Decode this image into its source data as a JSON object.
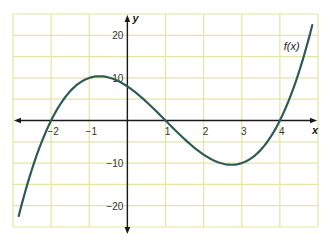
{
  "chart_data": {
    "type": "line",
    "title": "",
    "xlabel": "x",
    "ylabel": "y",
    "xlim": [
      -3,
      5
    ],
    "ylim": [
      -25,
      25
    ],
    "grid": true,
    "x_ticks": [
      -2,
      -1,
      1,
      2,
      3,
      4
    ],
    "x_tick_labels": [
      "−2",
      "−1",
      "1",
      "2",
      "3",
      "4"
    ],
    "y_ticks": [
      20,
      10,
      -10,
      -20
    ],
    "y_tick_labels": [
      "20",
      "10",
      "−10",
      "−20"
    ],
    "grid_x_step": 1,
    "grid_y_step": 5,
    "series": [
      {
        "name": "f(x)",
        "function": "(x+2)(x-1)(x-4)",
        "x": [
          -2.85,
          -2.5,
          -2,
          -1.5,
          -1,
          -0.73,
          -0.5,
          0,
          0.5,
          1,
          1.5,
          2,
          2.5,
          2.73,
          3,
          3.5,
          4,
          4.5,
          4.85
        ],
        "y": [
          -25,
          -14.6,
          0,
          7.9,
          10,
          10.4,
          10.1,
          8,
          4.4,
          0,
          -4.4,
          -8,
          -10.1,
          -10.4,
          -10,
          -7.9,
          0,
          14.6,
          25
        ]
      }
    ],
    "annotations": [
      {
        "text": "f(x)",
        "x": 4.1,
        "y": 16.5
      }
    ],
    "colors": {
      "curve": "#2f5b57",
      "grid": "#e3e6a2",
      "axes": "#1a1a1a",
      "background": "#ffffff"
    }
  }
}
